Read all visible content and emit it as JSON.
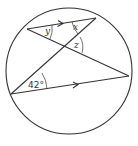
{
  "diagram": {
    "type": "circle-geometry",
    "colors": {
      "stroke": "#333333",
      "background": "#ffffff"
    },
    "circle": {
      "cx": 69,
      "cy": 71,
      "r": 63
    },
    "points": {
      "A": [
        27,
        29
      ],
      "B": [
        96,
        18
      ],
      "C": [
        129,
        76
      ],
      "D": [
        11,
        94
      ],
      "E": [
        64,
        47
      ]
    },
    "segments": [
      {
        "name": "chord-AB",
        "from": "A",
        "to": "B",
        "parallel_arrow": true
      },
      {
        "name": "chord-AC",
        "from": "A",
        "to": "C",
        "parallel_arrow": false
      },
      {
        "name": "chord-BD",
        "from": "B",
        "to": "D",
        "parallel_arrow": false
      },
      {
        "name": "chord-DC",
        "from": "D",
        "to": "C",
        "parallel_arrow": true
      }
    ],
    "labels": {
      "x": "x",
      "y": "y",
      "z": "z",
      "angle_d": "42°"
    }
  }
}
